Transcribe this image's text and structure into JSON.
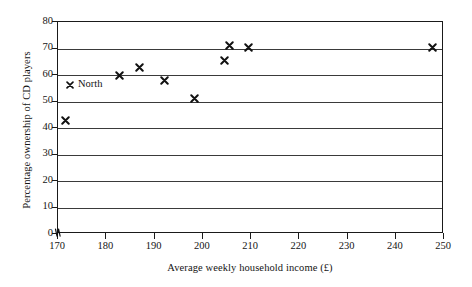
{
  "chart_data": {
    "type": "scatter",
    "title": "",
    "xlabel": "Average weekly household income (£)",
    "ylabel": "Percentage ownership of CD players",
    "xlim": [
      170,
      250
    ],
    "ylim": [
      0,
      80
    ],
    "xticks": [
      170,
      180,
      190,
      200,
      210,
      220,
      230,
      240,
      250
    ],
    "yticks": [
      0,
      10,
      20,
      30,
      40,
      50,
      60,
      70,
      80
    ],
    "grid": "horizontal",
    "axis_break": "y-axis origin break symbol",
    "legend_position": "inside-left",
    "series": [
      {
        "name": "North",
        "marker": "x",
        "color": "#111111",
        "points": [
          {
            "x": 171.5,
            "y": 43
          },
          {
            "x": 182.8,
            "y": 60
          },
          {
            "x": 186.9,
            "y": 63
          },
          {
            "x": 192.1,
            "y": 58
          },
          {
            "x": 198.2,
            "y": 51
          },
          {
            "x": 204.4,
            "y": 65.5
          },
          {
            "x": 205.6,
            "y": 71
          },
          {
            "x": 209.5,
            "y": 70.5
          },
          {
            "x": 247.7,
            "y": 70.5
          }
        ]
      }
    ],
    "legend": [
      {
        "label": "North",
        "marker": "x"
      }
    ]
  },
  "axis": {
    "x_title": "Average weekly household income (£)",
    "y_title": "Percentage ownership of CD players",
    "x_tick_labels": [
      "170",
      "180",
      "190",
      "200",
      "210",
      "220",
      "230",
      "240",
      "250"
    ],
    "y_tick_labels": [
      "0",
      "10",
      "20",
      "30",
      "40",
      "50",
      "60",
      "70",
      "80"
    ]
  },
  "legend": {
    "north_label": "North"
  },
  "colors": {
    "marker": "#111111",
    "frame": "#1a1a1a",
    "gridline": "#3a3a3a",
    "background": "#ffffff"
  }
}
